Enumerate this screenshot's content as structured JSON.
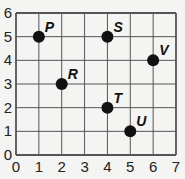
{
  "chart_data": {
    "type": "scatter",
    "title": "",
    "xlabel": "",
    "ylabel": "",
    "xlim": [
      0,
      7
    ],
    "ylim": [
      0,
      6
    ],
    "grid": true,
    "legend": null,
    "x_ticks": [
      "0",
      "1",
      "2",
      "3",
      "4",
      "5",
      "6",
      "7"
    ],
    "y_ticks": [
      "0",
      "1",
      "2",
      "3",
      "4",
      "5",
      "6"
    ],
    "points": [
      {
        "label": "P",
        "x": 1,
        "y": 5
      },
      {
        "label": "S",
        "x": 4,
        "y": 5
      },
      {
        "label": "V",
        "x": 6,
        "y": 4
      },
      {
        "label": "R",
        "x": 2,
        "y": 3
      },
      {
        "label": "T",
        "x": 4,
        "y": 2
      },
      {
        "label": "U",
        "x": 5,
        "y": 1
      }
    ]
  },
  "colors": {
    "grid": "#555555",
    "point": "#111111",
    "background": "#f4f4f2"
  }
}
